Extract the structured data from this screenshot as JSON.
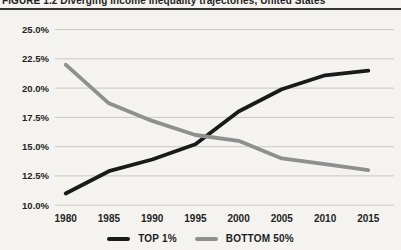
{
  "figure": {
    "title": "FIGURE 1.2  Diverging income inequality trajectories, United States"
  },
  "colors": {
    "top1_line": "#1a1a1a",
    "bottom50_line": "#8f8f8f",
    "gridline": "#c9c8c5",
    "paper": "#f4f3f0",
    "text": "#242424",
    "title_rule": "#343434"
  },
  "legend": {
    "items": [
      {
        "label": "TOP 1%",
        "color": "#1a1a1a"
      },
      {
        "label": "BOTTOM 50%",
        "color": "#8f8f8f"
      }
    ]
  },
  "chart_data": {
    "type": "line",
    "title": "FIGURE 1.2  Diverging income inequality trajectories, United States",
    "x": [
      1980,
      1985,
      1990,
      1995,
      2000,
      2005,
      2010,
      2015
    ],
    "x_tick_labels": [
      "1980",
      "1985",
      "1990",
      "1995",
      "2000",
      "2005",
      "2010",
      "2015"
    ],
    "y_ticks": [
      10,
      12.5,
      15,
      17.5,
      20,
      22.5,
      25
    ],
    "y_tick_labels": [
      "10.0%",
      "12.5%",
      "15.0%",
      "17.5%",
      "20.0%",
      "22.5%",
      "25.0%"
    ],
    "ylim": [
      10,
      25
    ],
    "xlabel": "",
    "ylabel": "",
    "grid": true,
    "legend_position": "bottom",
    "series": [
      {
        "name": "TOP 1%",
        "color": "#1a1a1a",
        "values": [
          11.0,
          12.9,
          13.9,
          15.2,
          18.0,
          19.9,
          21.1,
          21.5
        ]
      },
      {
        "name": "BOTTOM 50%",
        "color": "#8f8f8f",
        "values": [
          22.0,
          18.7,
          17.2,
          16.0,
          15.5,
          14.0,
          13.5,
          13.0
        ]
      }
    ]
  }
}
